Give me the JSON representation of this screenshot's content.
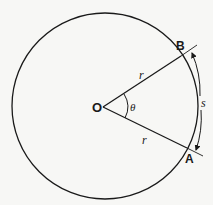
{
  "diagram": {
    "labels": {
      "center": "O",
      "point_b": "B",
      "point_a": "A",
      "radius_upper": "r",
      "radius_lower": "r",
      "angle": "θ",
      "arc_length": "s"
    },
    "colors": {
      "background": "#f7f7f5",
      "stroke": "#1a1a1a"
    }
  }
}
